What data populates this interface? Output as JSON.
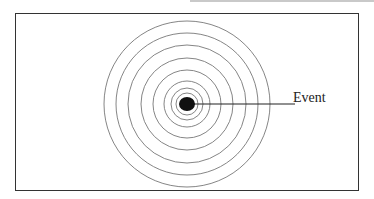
{
  "diagram": {
    "label": "Event",
    "center": {
      "x": 187,
      "y": 104
    },
    "ring_radii": [
      83,
      71,
      59,
      46,
      34,
      23,
      16,
      11
    ],
    "dot_radius": 8,
    "line_end_x": 295,
    "colors": {
      "ring": "#777777",
      "dot": "#111111",
      "line": "#222222",
      "frame": "#333333"
    }
  }
}
